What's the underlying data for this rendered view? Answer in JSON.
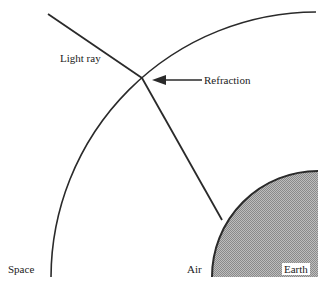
{
  "diagram": {
    "labels": {
      "light_ray": "Light ray",
      "refraction": "Refraction",
      "space": "Space",
      "air": "Air",
      "earth": "Earth"
    },
    "colors": {
      "line": "#2a2a2a",
      "earth_fill": "#a8a8a8",
      "background": "#ffffff"
    },
    "geometry": {
      "atmosphere_arc": {
        "center": [
          318,
          278
        ],
        "radius": 266
      },
      "earth": {
        "center": [
          318,
          277
        ],
        "radius": 106
      },
      "incident_ray": {
        "from": [
          48,
          14
        ],
        "to": [
          142,
          78
        ]
      },
      "refracted_ray": {
        "from": [
          142,
          78
        ],
        "to": [
          222,
          220
        ]
      },
      "refraction_arrow": {
        "from": [
          202,
          80
        ],
        "to": [
          153,
          80
        ]
      }
    }
  }
}
